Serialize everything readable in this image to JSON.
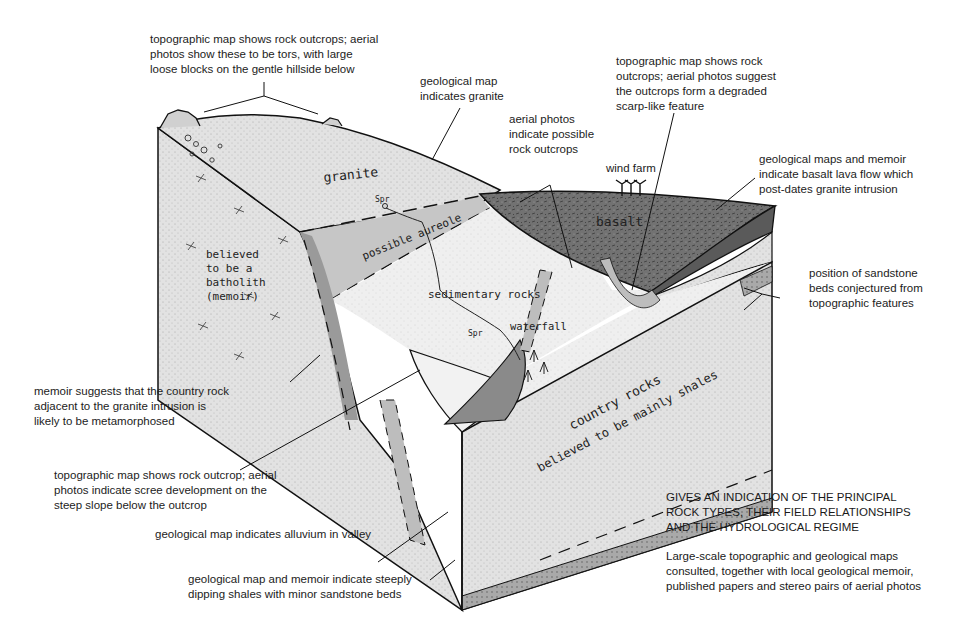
{
  "diagram": {
    "type": "geological block diagram (hand-sketched)",
    "colors": {
      "background": "#ffffff",
      "granite_fill": "#dcdcdc",
      "basalt_fill": "#6e6e6e",
      "aureole_fill": "#c4c4c4",
      "sediment_fill": "#ededed",
      "country_rock_fill": "#e4e4e4",
      "sandstone_bed_fill": "#a8a8a8",
      "ink": "#111111"
    },
    "sketch_labels": {
      "granite": "granite",
      "batholith": [
        "believed",
        "to be a",
        "batholith",
        "(memoir)"
      ],
      "aureole": "possible aureole",
      "sediments": "sedimentary rocks",
      "waterfall": "waterfall",
      "basalt": "basalt",
      "country_rocks_1": "country rocks",
      "country_rocks_2": "believed to be mainly shales",
      "spring_1": "Spr",
      "spring_2": "Spr",
      "question_mark": "?"
    },
    "features": {
      "wind_farm_label": "wind farm"
    },
    "annotations": [
      {
        "id": "tors",
        "text": "topographic map shows rock outcrops; aerial\nphotos show these to be tors, with large\nloose blocks on the gentle hillside below"
      },
      {
        "id": "granite-map",
        "text": "geological map\nindicates granite"
      },
      {
        "id": "aerial-outcrops",
        "text": "aerial photos\nindicate possible\nrock outcrops"
      },
      {
        "id": "scarp",
        "text": "topographic map shows rock\noutcrops; aerial photos suggest\nthe outcrops form a degraded\nscarp-like feature"
      },
      {
        "id": "basalt",
        "text": "geological maps and memoir\nindicate basalt lava flow which\npost-dates granite intrusion"
      },
      {
        "id": "sandstone-beds",
        "text": "position of sandstone\nbeds conjectured from\ntopographic features"
      },
      {
        "id": "metamorphosed",
        "text": "memoir suggests that the country rock\nadjacent to the granite intrusion is\nlikely to be metamorphosed"
      },
      {
        "id": "scree",
        "text": "topographic map shows rock outcrop; aerial\nphotos indicate scree development on the\nsteep slope below the outcrop"
      },
      {
        "id": "alluvium",
        "text": "geological map indicates alluvium in valley"
      },
      {
        "id": "shales",
        "text": "geological map and memoir indicate steeply\ndipping shales with minor sandstone beds"
      }
    ],
    "caption": {
      "heading": "GIVES AN INDICATION OF THE PRINCIPAL\nROCK TYPES, THEIR FIELD RELATIONSHIPS\nAND THE HYDROLOGICAL REGIME",
      "sources": "Large-scale topographic and geological maps\nconsulted, together with local geological memoir,\npublished papers and stereo pairs of aerial photos"
    }
  }
}
